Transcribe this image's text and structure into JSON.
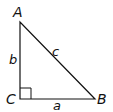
{
  "diagram": {
    "type": "right-triangle",
    "vertices": {
      "A": "A",
      "B": "B",
      "C": "C"
    },
    "sides": {
      "a": "a",
      "b": "b",
      "c": "c"
    },
    "right_angle_at": "C",
    "colors": {
      "stroke": "#111111",
      "background": "#ffffff"
    }
  }
}
